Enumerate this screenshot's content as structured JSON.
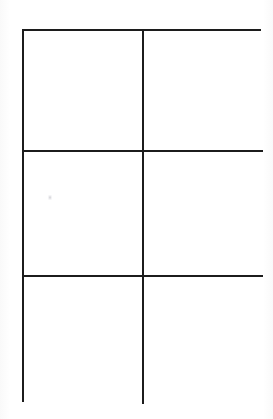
{
  "document": {
    "title": "Blank Six-Cell Grid Worksheet",
    "kind": "scanned-blank-grid",
    "background_color": "#ffffff",
    "line_color": "#1c1c1c",
    "line_width_px": 2
  },
  "grid": {
    "columns": 2,
    "rows": 3,
    "total_cells": 6,
    "bounds": {
      "left_px": 22,
      "top_px": 29,
      "width_px": 239,
      "height_px": 373
    },
    "column_widths_px": [
      120,
      119
    ],
    "row_heights_px": [
      121,
      125,
      127
    ],
    "vertical_divider_x_px": [
      142
    ],
    "horizontal_divider_y_px": [
      150,
      275
    ],
    "cells": [
      {
        "row": 1,
        "column": 1,
        "label": "",
        "content": ""
      },
      {
        "row": 1,
        "column": 2,
        "label": "",
        "content": ""
      },
      {
        "row": 2,
        "column": 1,
        "label": "",
        "content": ""
      },
      {
        "row": 2,
        "column": 2,
        "label": "",
        "content": ""
      },
      {
        "row": 3,
        "column": 1,
        "label": "",
        "content": ""
      },
      {
        "row": 3,
        "column": 2,
        "label": "",
        "content": ""
      }
    ]
  },
  "artifacts": {
    "smudge": {
      "name": "scan-smudge",
      "x_px": 48,
      "y_px": 195,
      "color": "#9a9aa0"
    }
  }
}
